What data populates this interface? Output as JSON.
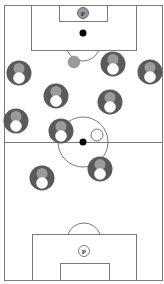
{
  "diagram": {
    "colors": {
      "line": "#7a7a7a",
      "player_body": "#5a5a5a",
      "player_head": "#9a9a9a",
      "player_chest": "#ffffff",
      "ball": "#000000",
      "grey_marker": "#9a9a9a"
    },
    "pitch": {
      "outline": {
        "x": 4,
        "y": 5,
        "w": 158,
        "h": 275
      },
      "halfway_line_y": 142,
      "center_circle": {
        "cx": 83,
        "cy": 142,
        "r": 25
      },
      "top_penalty_box": {
        "x": 31,
        "y": 5,
        "w": 105,
        "h": 45
      },
      "top_goal_box": {
        "x": 59,
        "y": 5,
        "w": 48,
        "h": 16
      },
      "top_arc": {
        "cx": 83,
        "cy": 44,
        "r": 17
      },
      "bottom_penalty_box": {
        "x": 32,
        "y": 234,
        "w": 104,
        "h": 46
      },
      "bottom_goal_box": {
        "x": 60,
        "y": 263,
        "w": 49,
        "h": 17
      },
      "bottom_arc": {
        "cx": 84,
        "cy": 240,
        "r": 17
      }
    },
    "penalty_spots": [
      {
        "label": "P",
        "cx": 83,
        "cy": 13,
        "style": "filled"
      },
      {
        "label": "P",
        "cx": 84,
        "cy": 251,
        "style": "outline"
      }
    ],
    "balls": [
      {
        "cx": 83,
        "cy": 33
      },
      {
        "cx": 83,
        "cy": 142
      }
    ],
    "markers": [
      {
        "type": "grey",
        "cx": 74,
        "cy": 62,
        "r": 6
      },
      {
        "type": "white",
        "cx": 97,
        "cy": 135,
        "r": 6
      }
    ],
    "players": [
      {
        "cx": 19,
        "cy": 73
      },
      {
        "cx": 113,
        "cy": 64
      },
      {
        "cx": 150,
        "cy": 72
      },
      {
        "cx": 56,
        "cy": 96
      },
      {
        "cx": 110,
        "cy": 102
      },
      {
        "cx": 16,
        "cy": 121
      },
      {
        "cx": 61,
        "cy": 131
      },
      {
        "cx": 100,
        "cy": 169
      },
      {
        "cx": 42,
        "cy": 178
      }
    ]
  }
}
